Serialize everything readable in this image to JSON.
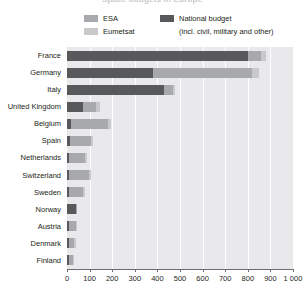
{
  "chart_title": "Space budgets in Europe",
  "legend": {
    "items": [
      {
        "id": "esa",
        "label": "ESA",
        "sub": "",
        "color": "#a7a9ac"
      },
      {
        "id": "eumetsat",
        "label": "Eumetsat",
        "sub": "",
        "color": "#c8c9cb"
      },
      {
        "id": "national",
        "label": "National budget",
        "sub": "(incl. civil, military and other)",
        "color": "#58595b"
      }
    ]
  },
  "axis": {
    "x_ticks": [
      "0",
      "100",
      "200",
      "300",
      "400",
      "500",
      "600",
      "700",
      "800",
      "900",
      "1 000"
    ],
    "x_min": 0,
    "x_max": 1000,
    "x_step": 100
  },
  "chart_data": {
    "type": "bar",
    "orientation": "horizontal",
    "stacked": true,
    "title": "Space budgets in Europe",
    "xlabel": "",
    "ylabel": "",
    "xlim": [
      0,
      1000
    ],
    "grid": true,
    "legend_position": "top",
    "categories": [
      "France",
      "Germany",
      "Italy",
      "United Kingdom",
      "Belgium",
      "Spain",
      "Netherlands",
      "Switzerland",
      "Sweden",
      "Norway",
      "Austria",
      "Denmark",
      "Finland"
    ],
    "series": [
      {
        "name": "National budget",
        "color": "#58595b",
        "values": [
          800,
          380,
          430,
          70,
          18,
          12,
          10,
          8,
          10,
          40,
          10,
          8,
          8
        ]
      },
      {
        "name": "ESA",
        "color": "#a7a9ac",
        "values": [
          60,
          440,
          40,
          60,
          165,
          95,
          68,
          90,
          60,
          4,
          30,
          24,
          18
        ]
      },
      {
        "name": "Eumetsat",
        "color": "#c8c9cb",
        "values": [
          20,
          30,
          10,
          15,
          12,
          8,
          12,
          7,
          10,
          0,
          5,
          6,
          2
        ]
      }
    ],
    "totals": [
      880,
      850,
      480,
      145,
      195,
      115,
      90,
      105,
      80,
      44,
      45,
      38,
      28
    ]
  },
  "colors": {
    "plot_background": "#e9e9ec",
    "gridline": "#ffffff",
    "axis": "#6d6e71",
    "text": "#231f20"
  }
}
